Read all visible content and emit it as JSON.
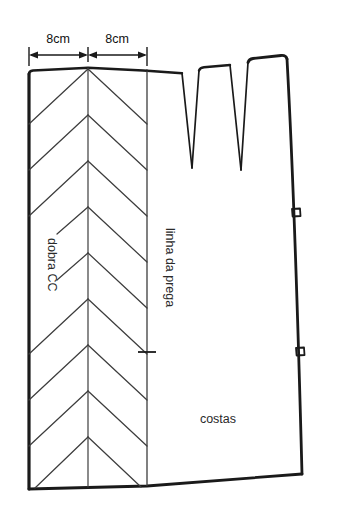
{
  "diagram": {
    "background_color": "#ffffff",
    "ink_color": "#1a1a1a",
    "thin_ink_color": "#4a4a4a",
    "width_px": 337,
    "height_px": 523
  },
  "dimensions": [
    {
      "id": "dim-left",
      "label": "8cm"
    },
    {
      "id": "dim-right",
      "label": "8cm"
    }
  ],
  "labels": {
    "fold_line": "dobra CC",
    "pleat_line": "linha da prega",
    "back_piece": "costas"
  },
  "markings": {
    "notch_count": 2,
    "dart_count": 2,
    "chevron_rows": 9
  }
}
